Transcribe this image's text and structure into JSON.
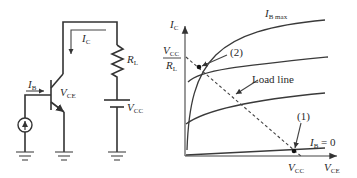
{
  "circuit": {
    "collector_current_label": {
      "sym": "I",
      "sub": "C"
    },
    "base_current_label": {
      "sym": "I",
      "sub": "B"
    },
    "vce_label": {
      "sym": "V",
      "sub": "CE"
    },
    "resistor_label": {
      "sym": "R",
      "sub": "L"
    },
    "supply_label": {
      "sym": "V",
      "sub": "CC"
    }
  },
  "graph": {
    "y_axis_label": {
      "sym": "I",
      "sub": "C"
    },
    "x_axis_label": {
      "sym": "V",
      "sub": "CE"
    },
    "y_intercept_label": {
      "num_sym": "V",
      "num_sub": "CC",
      "den_sym": "R",
      "den_sub": "L"
    },
    "x_intercept_label": {
      "sym": "V",
      "sub": "CC"
    },
    "curve_top_label": {
      "sym": "I",
      "sub": "B max"
    },
    "curve_bottom_label": {
      "sym": "I",
      "sub": "B",
      "eq": " = 0"
    },
    "load_line_label": "Load line",
    "point_2_label": "(2)",
    "point_1_label": "(1)"
  },
  "colors": {
    "ink": "#333333",
    "background": "#ffffff"
  }
}
